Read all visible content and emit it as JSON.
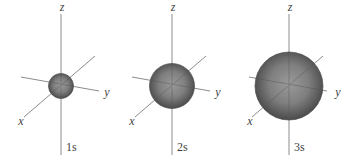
{
  "figure": {
    "colors": {
      "background": "#ffffff",
      "axis_line": "#8c8c8c",
      "axis_line_over_sphere": "#565656",
      "text": "#3f3f3f",
      "sphere_gradient_center": "#9b9b9b",
      "sphere_gradient_mid": "#7f7f7f",
      "sphere_gradient_edge": "#4b4b4b",
      "sphere_outline": "#4a4a4a"
    },
    "diagrams": [
      {
        "orbital_label": "1s",
        "axis_x_label": "x",
        "axis_y_label": "y",
        "axis_z_label": "z",
        "sphere_radius": 12.5
      },
      {
        "orbital_label": "2s",
        "axis_x_label": "x",
        "axis_y_label": "y",
        "axis_z_label": "z",
        "sphere_radius": 22.5
      },
      {
        "orbital_label": "3s",
        "axis_x_label": "x",
        "axis_y_label": "y",
        "axis_z_label": "z",
        "sphere_radius": 34
      }
    ]
  }
}
